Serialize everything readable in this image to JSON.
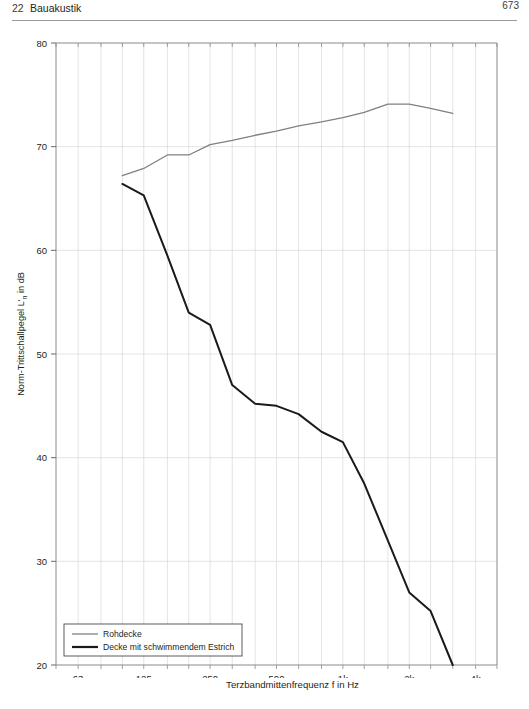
{
  "header": {
    "chapter_number": "22",
    "chapter_title": "Bauakustik",
    "page_number": "673"
  },
  "chart_data": {
    "type": "line",
    "title": "",
    "xlabel": "Terzbandmittenfrequenz f in Hz",
    "ylabel_prefix": "Norm-Trittschallpegel L'",
    "ylabel_sub": "n",
    "ylabel_suffix": " in dB",
    "ylabel_full": "Norm-Trittschallpegel L'n in dB",
    "xscale": "log",
    "xlim": [
      50,
      5000
    ],
    "ylim": [
      20,
      80
    ],
    "grid": true,
    "xtick_labels": [
      "63",
      "125",
      "250",
      "500",
      "1k",
      "2k",
      "4k"
    ],
    "xtick_values": [
      63,
      125,
      250,
      500,
      1000,
      2000,
      4000
    ],
    "xminor_values": [
      50,
      63,
      80,
      100,
      125,
      160,
      200,
      250,
      315,
      400,
      500,
      630,
      800,
      1000,
      1250,
      1600,
      2000,
      2500,
      3150,
      4000,
      5000
    ],
    "ytick_labels": [
      "20",
      "30",
      "40",
      "50",
      "60",
      "70",
      "80"
    ],
    "ytick_values": [
      20,
      30,
      40,
      50,
      60,
      70,
      80
    ],
    "legend_position": "bottom-left",
    "series": [
      {
        "name": "Rohdecke",
        "color": "#808080",
        "x": [
          100,
          125,
          160,
          200,
          250,
          315,
          400,
          500,
          630,
          800,
          1000,
          1250,
          1600,
          2000,
          2500,
          3150
        ],
        "values": [
          67.2,
          67.9,
          69.2,
          69.2,
          70.2,
          70.6,
          71.1,
          71.5,
          72.0,
          72.4,
          72.8,
          73.3,
          74.1,
          74.1,
          73.7,
          73.2
        ]
      },
      {
        "name": "Decke mit schwimmendem Estrich",
        "color": "#1a1a1a",
        "x": [
          100,
          125,
          160,
          200,
          250,
          315,
          400,
          500,
          630,
          800,
          1000,
          1250,
          1600,
          2000,
          2500,
          3150
        ],
        "values": [
          66.4,
          65.3,
          59.5,
          54.0,
          52.8,
          47.0,
          45.2,
          45.0,
          44.2,
          42.5,
          41.5,
          37.5,
          32.0,
          27.0,
          25.2,
          20.0
        ]
      }
    ]
  }
}
